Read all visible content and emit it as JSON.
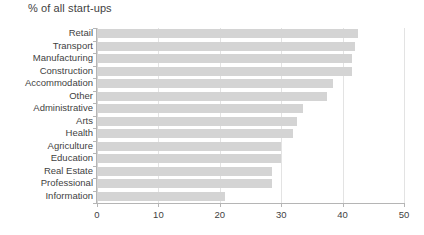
{
  "chart_data": {
    "type": "bar",
    "orientation": "horizontal",
    "title": "% of all start-ups",
    "xlabel": "",
    "ylabel": "",
    "xlim": [
      0,
      50
    ],
    "xticks": [
      0,
      10,
      20,
      30,
      40,
      50
    ],
    "grid": true,
    "legend": false,
    "bar_color": "#d4d4d4",
    "categories": [
      "Retail",
      "Transport",
      "Manufacturing",
      "Construction",
      "Accommodation",
      "Other",
      "Administrative",
      "Arts",
      "Health",
      "Agriculture",
      "Education",
      "Real Estate",
      "Professional",
      "Information"
    ],
    "values": [
      42.5,
      42,
      41.5,
      41.5,
      38.5,
      37.5,
      33.5,
      32.5,
      32,
      30,
      30,
      28.5,
      28.5,
      20.8
    ]
  }
}
